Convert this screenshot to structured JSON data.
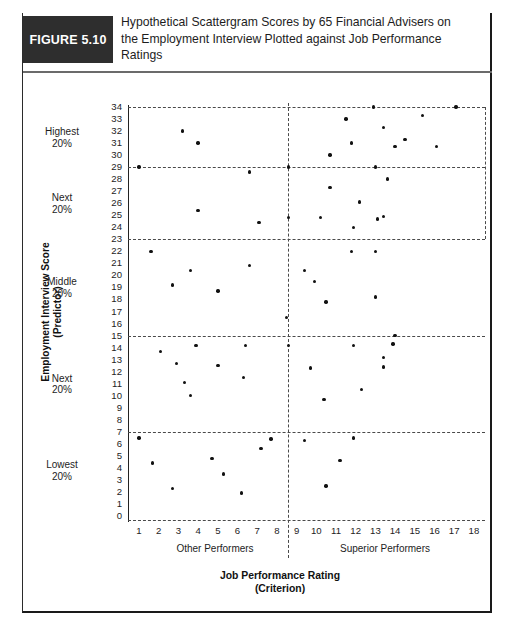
{
  "figure": {
    "tag": "FIGURE 5.10",
    "title": "Hypothetical Scattergram Scores by 65 Financial Advisers on the Employment Interview Plotted against Job Performance Ratings"
  },
  "axis": {
    "ylabel_line1": "Employment Interview Score",
    "ylabel_line2": "(Predictor)",
    "xlabel_line1": "Job Performance Rating",
    "xlabel_line2": "(Criterion)"
  },
  "band_labels": [
    {
      "line1": "Highest",
      "line2": "20%"
    },
    {
      "line1": "Next",
      "line2": "20%"
    },
    {
      "line1": "Middle",
      "line2": "20%"
    },
    {
      "line1": "Next",
      "line2": "20%"
    },
    {
      "line1": "Lowest",
      "line2": "20%"
    }
  ],
  "region_labels": {
    "left": "Other Performers",
    "right": "Superior Performers"
  },
  "yticks": [
    34,
    33,
    32,
    31,
    30,
    29,
    28,
    27,
    26,
    25,
    24,
    23,
    22,
    21,
    20,
    19,
    18,
    17,
    16,
    15,
    14,
    13,
    12,
    11,
    10,
    9,
    8,
    7,
    6,
    5,
    4,
    3,
    2,
    1,
    0
  ],
  "xticks": [
    1,
    2,
    3,
    4,
    5,
    6,
    7,
    8,
    9,
    10,
    11,
    12,
    13,
    14,
    15,
    16,
    17,
    18
  ],
  "chart_data": {
    "type": "scatter",
    "title": "Hypothetical Scattergram Scores by 65 Financial Advisers on the Employment Interview Plotted against Job Performance Ratings",
    "xlabel": "Job Performance Rating (Criterion)",
    "ylabel": "Employment Interview Score (Predictor)",
    "xlim": [
      0,
      18.6
    ],
    "ylim": [
      0,
      34.5
    ],
    "grid": false,
    "legend": null,
    "n_points": 65,
    "reference_lines": {
      "vertical": [
        9
      ],
      "horizontal": [
        29,
        23,
        15,
        7,
        34
      ]
    },
    "quintile_bands": [
      {
        "label": "Highest 20%",
        "range": [
          29,
          34
        ]
      },
      {
        "label": "Next 20%",
        "range": [
          23,
          29
        ]
      },
      {
        "label": "Middle 20%",
        "range": [
          15,
          23
        ]
      },
      {
        "label": "Next 20%",
        "range": [
          7,
          15
        ]
      },
      {
        "label": "Lowest 20%",
        "range": [
          0,
          7
        ]
      }
    ],
    "points": [
      [
        3.2,
        32
      ],
      [
        4.0,
        31
      ],
      [
        10.7,
        30
      ],
      [
        11.5,
        33
      ],
      [
        11.8,
        31
      ],
      [
        12.9,
        34
      ],
      [
        13.4,
        32.3
      ],
      [
        14.0,
        30.7
      ],
      [
        14.5,
        31.3
      ],
      [
        15.4,
        33.3
      ],
      [
        16.1,
        30.7
      ],
      [
        17.1,
        34
      ],
      [
        1.0,
        29
      ],
      [
        6.6,
        28.6
      ],
      [
        4.0,
        25.4
      ],
      [
        7.1,
        24.4
      ],
      [
        8.6,
        29
      ],
      [
        10.7,
        27.3
      ],
      [
        12.2,
        26.1
      ],
      [
        8.6,
        24.8
      ],
      [
        10.2,
        24.8
      ],
      [
        11.9,
        24.0
      ],
      [
        13.1,
        24.7
      ],
      [
        13.0,
        29
      ],
      [
        13.6,
        28.0
      ],
      [
        13.4,
        24.9
      ],
      [
        1.6,
        22
      ],
      [
        3.6,
        20.4
      ],
      [
        2.7,
        19.2
      ],
      [
        5.0,
        18.7
      ],
      [
        6.6,
        20.8
      ],
      [
        8.5,
        16.5
      ],
      [
        9.4,
        20.4
      ],
      [
        9.9,
        19.5
      ],
      [
        10.5,
        17.8
      ],
      [
        11.8,
        22
      ],
      [
        13.0,
        22
      ],
      [
        13.0,
        18.2
      ],
      [
        2.1,
        13.7
      ],
      [
        3.9,
        14.2
      ],
      [
        2.9,
        12.7
      ],
      [
        3.3,
        11.1
      ],
      [
        3.6,
        10.0
      ],
      [
        5.0,
        12.5
      ],
      [
        6.3,
        11.5
      ],
      [
        6.4,
        14.2
      ],
      [
        8.6,
        14.2
      ],
      [
        9.7,
        12.3
      ],
      [
        10.4,
        9.7
      ],
      [
        11.9,
        14.2
      ],
      [
        12.3,
        10.5
      ],
      [
        13.4,
        12.4
      ],
      [
        13.9,
        14.3
      ],
      [
        14.0,
        15.0
      ],
      [
        13.4,
        13.2
      ],
      [
        1.0,
        6.5
      ],
      [
        1.7,
        4.4
      ],
      [
        2.7,
        2.3
      ],
      [
        4.7,
        4.8
      ],
      [
        5.3,
        3.5
      ],
      [
        6.2,
        1.9
      ],
      [
        7.2,
        5.6
      ],
      [
        7.7,
        6.4
      ],
      [
        9.4,
        6.3
      ],
      [
        10.5,
        2.5
      ],
      [
        11.2,
        4.6
      ],
      [
        11.9,
        6.5
      ]
    ]
  }
}
